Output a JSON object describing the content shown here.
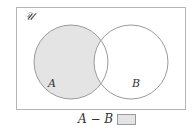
{
  "diagram": {
    "type": "venn",
    "universe_label": "𝒰",
    "sets": [
      {
        "name": "A",
        "label": "A",
        "shaded": true
      },
      {
        "name": "B",
        "label": "B",
        "shaded": false
      }
    ],
    "shaded_region": "A − B",
    "colors": {
      "shade": "#e4e4e4",
      "stroke": "#9a9a9a"
    }
  },
  "legend": {
    "expression": "A − B"
  }
}
